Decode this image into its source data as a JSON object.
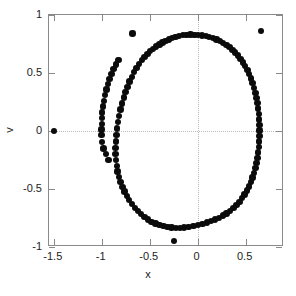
{
  "chart_data": {
    "type": "scatter",
    "title": "",
    "xlabel": "x",
    "ylabel": "v",
    "xlim": [
      -1.55,
      0.9
    ],
    "ylim": [
      -1.0,
      1.0
    ],
    "grid": true,
    "gridlines": {
      "x": [
        0
      ],
      "y": [
        0
      ]
    },
    "legend": null,
    "marker": {
      "shape": "circle",
      "color": "#0b0b0b",
      "size_px": 6.4
    },
    "xticks": [
      -1.5,
      -1,
      -0.5,
      0,
      0.5
    ],
    "xtick_labels": [
      "-1.5",
      "-1",
      "-0.5",
      "0",
      "0.5"
    ],
    "yticks": [
      -1,
      -0.5,
      0,
      0.5,
      1
    ],
    "ytick_labels": [
      "-1",
      "-0.5",
      "0",
      "0.5",
      "1"
    ],
    "series": [
      {
        "name": "orbit",
        "points": [
          [
            -0.035,
            0.83
          ],
          [
            -0.075,
            0.832
          ],
          [
            -0.115,
            0.83
          ],
          [
            -0.155,
            0.826
          ],
          [
            0.005,
            0.828
          ],
          [
            0.045,
            0.824
          ],
          [
            0.085,
            0.818
          ],
          [
            0.12,
            0.812
          ],
          [
            -0.195,
            0.818
          ],
          [
            -0.232,
            0.81
          ],
          [
            -0.268,
            0.8
          ],
          [
            -0.3,
            0.79
          ],
          [
            0.158,
            0.802
          ],
          [
            0.196,
            0.79
          ],
          [
            0.232,
            0.776
          ],
          [
            0.266,
            0.76
          ],
          [
            -0.335,
            0.776
          ],
          [
            -0.368,
            0.762
          ],
          [
            -0.4,
            0.746
          ],
          [
            -0.432,
            0.728
          ],
          [
            0.3,
            0.742
          ],
          [
            0.332,
            0.722
          ],
          [
            0.362,
            0.7
          ],
          [
            0.392,
            0.676
          ],
          [
            -0.463,
            0.708
          ],
          [
            -0.494,
            0.688
          ],
          [
            -0.524,
            0.664
          ],
          [
            -0.553,
            0.638
          ],
          [
            0.42,
            0.65
          ],
          [
            0.447,
            0.622
          ],
          [
            0.472,
            0.592
          ],
          [
            0.496,
            0.56
          ],
          [
            -0.582,
            0.61
          ],
          [
            -0.61,
            0.578
          ],
          [
            -0.637,
            0.544
          ],
          [
            -0.662,
            0.508
          ],
          [
            0.518,
            0.526
          ],
          [
            0.538,
            0.49
          ],
          [
            0.556,
            0.452
          ],
          [
            0.572,
            0.412
          ],
          [
            -0.687,
            0.468
          ],
          [
            -0.71,
            0.426
          ],
          [
            -0.732,
            0.382
          ],
          [
            -0.752,
            0.336
          ],
          [
            0.588,
            0.37
          ],
          [
            0.601,
            0.328
          ],
          [
            0.612,
            0.284
          ],
          [
            0.622,
            0.24
          ],
          [
            -0.771,
            0.288
          ],
          [
            -0.788,
            0.238
          ],
          [
            -0.804,
            0.186
          ],
          [
            -0.818,
            0.132
          ],
          [
            0.63,
            0.194
          ],
          [
            0.637,
            0.148
          ],
          [
            0.642,
            0.1
          ],
          [
            0.645,
            0.052
          ],
          [
            -0.83,
            0.078
          ],
          [
            -0.84,
            0.022
          ],
          [
            -0.848,
            -0.034
          ],
          [
            -0.854,
            -0.09
          ],
          [
            0.646,
            0.004
          ],
          [
            0.645,
            -0.044
          ],
          [
            0.642,
            -0.092
          ],
          [
            0.638,
            -0.14
          ],
          [
            -0.856,
            -0.146
          ],
          [
            -0.855,
            -0.2
          ],
          [
            -0.851,
            -0.252
          ],
          [
            -0.844,
            -0.302
          ],
          [
            0.632,
            -0.186
          ],
          [
            0.624,
            -0.232
          ],
          [
            0.614,
            -0.276
          ],
          [
            0.602,
            -0.32
          ],
          [
            -0.834,
            -0.35
          ],
          [
            -0.82,
            -0.396
          ],
          [
            -0.804,
            -0.44
          ],
          [
            -0.785,
            -0.482
          ],
          [
            0.588,
            -0.362
          ],
          [
            0.572,
            -0.402
          ],
          [
            0.554,
            -0.44
          ],
          [
            0.534,
            -0.478
          ],
          [
            -0.764,
            -0.522
          ],
          [
            -0.74,
            -0.56
          ],
          [
            -0.714,
            -0.596
          ],
          [
            -0.686,
            -0.63
          ],
          [
            0.512,
            -0.514
          ],
          [
            0.488,
            -0.548
          ],
          [
            0.462,
            -0.58
          ],
          [
            0.434,
            -0.61
          ],
          [
            -0.656,
            -0.662
          ],
          [
            -0.624,
            -0.692
          ],
          [
            -0.59,
            -0.718
          ],
          [
            -0.555,
            -0.742
          ],
          [
            0.404,
            -0.638
          ],
          [
            0.372,
            -0.664
          ],
          [
            0.338,
            -0.688
          ],
          [
            0.302,
            -0.71
          ],
          [
            -0.518,
            -0.764
          ],
          [
            -0.48,
            -0.782
          ],
          [
            -0.441,
            -0.798
          ],
          [
            -0.4,
            -0.81
          ],
          [
            0.264,
            -0.73
          ],
          [
            0.224,
            -0.748
          ],
          [
            0.182,
            -0.764
          ],
          [
            0.14,
            -0.778
          ],
          [
            -0.358,
            -0.82
          ],
          [
            -0.315,
            -0.828
          ],
          [
            -0.272,
            -0.832
          ],
          [
            -0.228,
            -0.834
          ],
          [
            0.096,
            -0.79
          ],
          [
            0.05,
            -0.8
          ],
          [
            0.004,
            -0.81
          ],
          [
            -0.042,
            -0.818
          ],
          [
            -0.184,
            -0.834
          ],
          [
            -0.14,
            -0.832
          ],
          [
            -0.096,
            -0.828
          ],
          [
            -1.0,
            0.06
          ],
          [
            -1.002,
            0.012
          ],
          [
            -1.004,
            -0.036
          ],
          [
            -1.0,
            0.11
          ],
          [
            -0.996,
            0.16
          ],
          [
            -0.988,
            0.21
          ],
          [
            -0.978,
            0.26
          ],
          [
            -0.966,
            0.31
          ],
          [
            -0.952,
            0.358
          ],
          [
            -0.936,
            0.404
          ],
          [
            -0.918,
            0.448
          ],
          [
            -0.898,
            0.492
          ],
          [
            -0.876,
            0.534
          ],
          [
            -0.852,
            0.574
          ],
          [
            -0.826,
            0.612
          ],
          [
            -0.996,
            -0.096
          ],
          [
            -0.98,
            -0.15
          ],
          [
            -0.958,
            -0.2
          ],
          [
            -0.93,
            -0.248
          ]
        ]
      },
      {
        "name": "outliers",
        "points": [
          [
            -1.5,
            0.0
          ],
          [
            -0.68,
            0.84
          ],
          [
            0.66,
            0.862
          ],
          [
            -0.25,
            -0.95
          ]
        ]
      }
    ]
  },
  "axes": {
    "x_title": "x",
    "y_title": "v"
  },
  "colors": {
    "marker": "#0b0b0b",
    "frame": "#8a8a8a",
    "grid": "#b9b9b9",
    "background": "#ffffff",
    "text": "#222222"
  }
}
